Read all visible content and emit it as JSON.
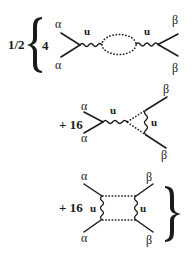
{
  "diagram": {
    "prefactor": "1/2",
    "terms": [
      {
        "coefficient": "4",
        "type": "bubble",
        "left_legs": [
          "α",
          "α"
        ],
        "right_legs": [
          "β",
          "β"
        ],
        "propagator_labels": [
          "u",
          "u"
        ]
      },
      {
        "coefficient": "+ 16",
        "type": "triangle",
        "left_legs": [
          "α",
          "α"
        ],
        "right_legs": [
          "β",
          "β"
        ],
        "propagator_labels": [
          "u",
          "u"
        ]
      },
      {
        "coefficient": "+ 16",
        "type": "box",
        "left_legs": [
          "α",
          "α"
        ],
        "right_legs": [
          "β",
          "β"
        ],
        "propagator_labels": [
          "u",
          "u"
        ]
      }
    ],
    "colors": {
      "ink": "#1a1a1a",
      "background": "#ffffff"
    }
  }
}
